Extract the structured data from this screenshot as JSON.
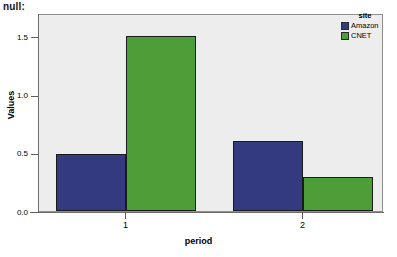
{
  "title": "null:",
  "chart_data": {
    "type": "bar",
    "title": "null:",
    "xlabel": "period",
    "ylabel": "Values",
    "categories": [
      "1",
      "2"
    ],
    "ylim": [
      0.0,
      1.7
    ],
    "yticks": [
      "0.0",
      "0.5",
      "1.0",
      "1.5"
    ],
    "ytick_values": [
      0.0,
      0.5,
      1.0,
      1.5
    ],
    "grid": false,
    "legend": {
      "title": "site",
      "position": "top-right",
      "entries": [
        {
          "label": "Amazon",
          "color": "#333a80"
        },
        {
          "label": "CNET",
          "color": "#4d9e39"
        }
      ]
    },
    "series": [
      {
        "name": "Amazon",
        "color": "#333a80",
        "values": [
          0.49,
          0.6
        ]
      },
      {
        "name": "CNET",
        "color": "#4d9e39",
        "values": [
          1.5,
          0.29
        ]
      }
    ]
  },
  "colors": {
    "plot_background": "#ecedec",
    "page_background": "#ffffff",
    "frame": "#8e8e8e",
    "bar_outline": "#1b1b1b",
    "amazon": "#333a80",
    "cnet": "#4d9e39"
  }
}
